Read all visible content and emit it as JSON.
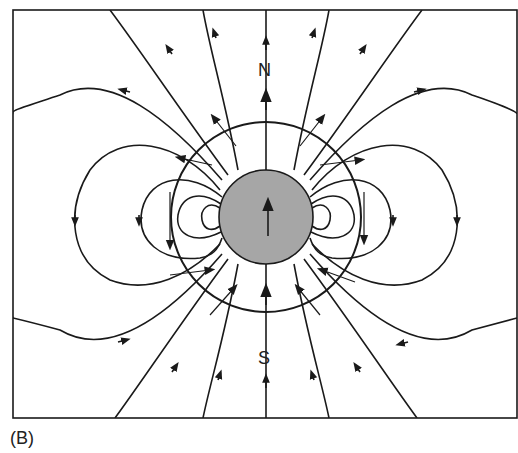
{
  "figure": {
    "panel_label": "(B)",
    "pole_north": "N",
    "pole_south": "S",
    "colors": {
      "line": "#1a1a1a",
      "sphere_fill": "#a6a6a6",
      "background": "#ffffff"
    }
  }
}
